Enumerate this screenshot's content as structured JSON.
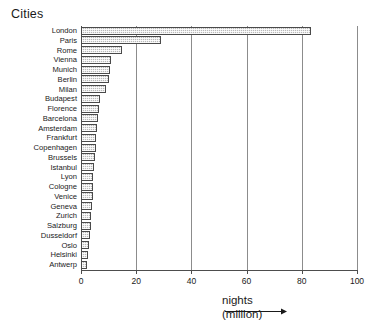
{
  "chart_data": {
    "type": "bar",
    "orientation": "horizontal",
    "title": "",
    "ylabel": "Cities",
    "xlabel": "nights (million)",
    "xlabel_line1": "nights",
    "xlabel_line2": "(million)",
    "xlim": [
      0,
      100
    ],
    "xticks": [
      0,
      20,
      40,
      60,
      80,
      100
    ],
    "xtick_labels": [
      "0",
      "20",
      "40",
      "60",
      "80",
      "100"
    ],
    "grid": true,
    "grid_axis": "x",
    "legend": null,
    "bar_fill_color": "#b9b9b9",
    "bar_edge_color": "#4a4a4a",
    "categories": [
      "London",
      "Paris",
      "Rome",
      "Vienna",
      "Munich",
      "Berlin",
      "Milan",
      "Budapest",
      "Florence",
      "Barcelona",
      "Amsterdam",
      "Frankfurt",
      "Copenhagen",
      "Brussels",
      "Istanbul",
      "Lyon",
      "Cologne",
      "Venice",
      "Geneva",
      "Zurich",
      "Salzburg",
      "Dusseldorf",
      "Oslo",
      "Helsinki",
      "Antwerp"
    ],
    "values": [
      83.5,
      29,
      15,
      11,
      10.5,
      10,
      9,
      7,
      6.5,
      6,
      5.8,
      5.5,
      5.3,
      5,
      4.8,
      4.5,
      4.3,
      4.2,
      4,
      3.8,
      3.5,
      3.3,
      3,
      2.6,
      2.2
    ]
  }
}
